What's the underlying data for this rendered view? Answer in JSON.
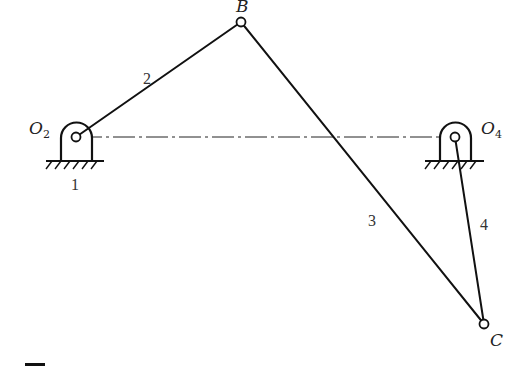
{
  "diagram": {
    "type": "four-bar linkage",
    "points": {
      "O2": {
        "label": "O",
        "subscript": "2",
        "x": 76,
        "y": 137
      },
      "O4": {
        "label": "O",
        "subscript": "4",
        "x": 455,
        "y": 137
      },
      "B": {
        "label": "B",
        "x": 241,
        "y": 22
      },
      "C": {
        "label": "C",
        "x": 484,
        "y": 324
      }
    },
    "links": [
      {
        "id": "1",
        "label": "1",
        "name": "ground / frame"
      },
      {
        "id": "2",
        "label": "2",
        "from": "O2",
        "to": "B"
      },
      {
        "id": "3",
        "label": "3",
        "from": "B",
        "to": "C"
      },
      {
        "id": "4",
        "label": "4",
        "from": "O4",
        "to": "C"
      }
    ],
    "center_line": {
      "from": "O2",
      "to": "O4",
      "style": "dash-dot"
    },
    "colors": {
      "ink": "#111111",
      "background": "#ffffff"
    }
  },
  "labels": {
    "O2_main": "O",
    "O2_sub": "2",
    "O4_main": "O",
    "O4_sub": "4",
    "B": "B",
    "C": "C",
    "link1": "1",
    "link2": "2",
    "link3": "3",
    "link4": "4"
  }
}
